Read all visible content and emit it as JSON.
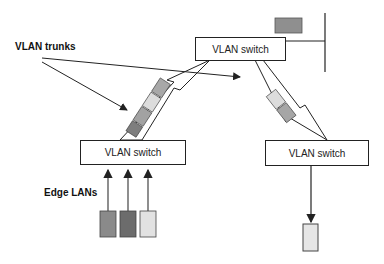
{
  "diagram": {
    "labels": {
      "vlan_trunks": "VLAN trunks",
      "edge_lans": "Edge LANs"
    },
    "switches": [
      {
        "id": "top",
        "label": "VLAN switch"
      },
      {
        "id": "left",
        "label": "VLAN switch"
      },
      {
        "id": "right",
        "label": "VLAN switch"
      }
    ],
    "colors": {
      "frame_dark": "#7a7a7a",
      "frame_mid": "#a8a8a8",
      "frame_light": "#dcdcdc",
      "frame_gray": "#929292",
      "line": "#222222"
    }
  }
}
